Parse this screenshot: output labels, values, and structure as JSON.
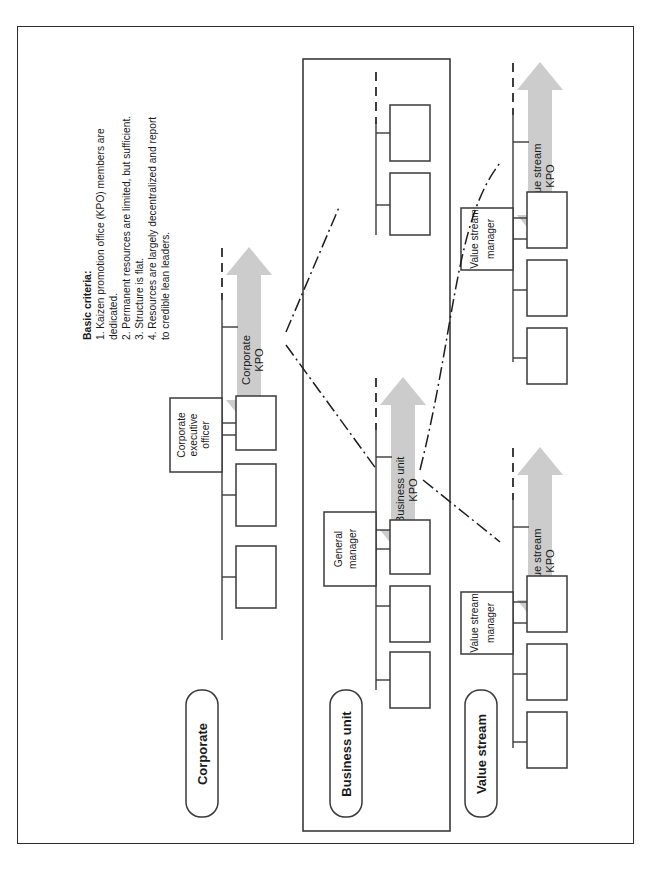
{
  "figure": {
    "orientation": "rotated-90-ccw",
    "page_border": true,
    "colors": {
      "arrow_gray": "#cccccc",
      "line": "#3a3a3a",
      "text": "#1a1a1a",
      "background": "#ffffff"
    }
  },
  "criteria": {
    "heading": "Basic criteria:",
    "items": [
      "1. Kaizen promotion office (KPO) members are",
      "    dedicated.",
      "2. Permanent resources are limited, but sufficient.",
      "3. Structure is flat.",
      "4. Resources are largely decentralized and report",
      "    to credible lean leaders."
    ]
  },
  "rows": [
    {
      "label": "Corporate",
      "boxed": false
    },
    {
      "label": "Business unit",
      "boxed": true
    },
    {
      "label": "Value stream",
      "boxed": false
    }
  ],
  "roles": [
    {
      "lines": [
        "Corporate",
        "executive",
        "officer"
      ]
    },
    {
      "lines": [
        "General",
        "manager"
      ]
    },
    {
      "lines": [
        "Value stream",
        "manager"
      ]
    },
    {
      "lines": [
        "Value stream",
        "manager"
      ]
    }
  ],
  "kpo_arrows": [
    {
      "lines": [
        "Corporate",
        "KPO"
      ]
    },
    {
      "lines": [
        "Business unit",
        "KPO"
      ]
    },
    {
      "lines": [
        "Value stream",
        "KPO"
      ]
    },
    {
      "lines": [
        "Value stream",
        "KPO"
      ]
    }
  ],
  "org_units": {
    "corporate_boxes": 3,
    "business_unit_lower_boxes": 3,
    "business_unit_upper_boxes": 2,
    "value_stream_top_boxes": 3,
    "value_stream_bottom_boxes": 3
  },
  "connectors": {
    "dash_dot_count": 3,
    "description": "dash-dot links between KPO groups"
  }
}
